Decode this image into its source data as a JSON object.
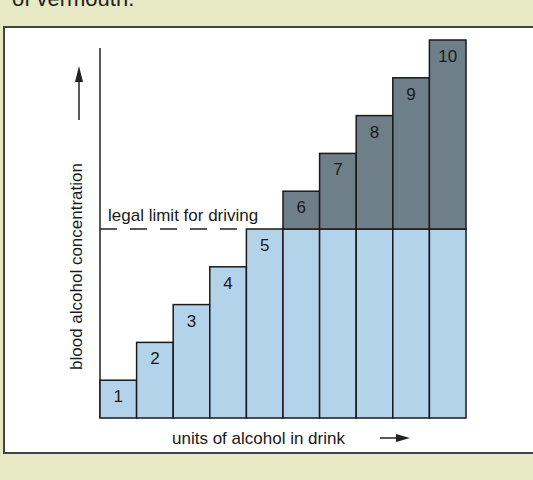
{
  "caption_top": "of vermouth.",
  "colors": {
    "background": "#e6e9c4",
    "panel": "#ffffff",
    "below_limit": "#b3d3ea",
    "above_limit": "#6f7f8a",
    "outline": "#1a1a1a"
  },
  "labels": {
    "y_axis": "blood alcohol concentration",
    "x_axis": "units of alcohol in drink",
    "limit_line": "legal limit for driving"
  },
  "chart_data": {
    "type": "bar",
    "title": "",
    "xlabel": "units of alcohol in drink",
    "ylabel": "blood alcohol concentration",
    "categories": [
      "1",
      "2",
      "3",
      "4",
      "5",
      "6",
      "7",
      "8",
      "9",
      "10"
    ],
    "values": [
      1,
      2,
      3,
      4,
      5,
      6,
      7,
      8,
      9,
      10
    ],
    "threshold": {
      "label": "legal limit for driving",
      "value": 5,
      "style": "dashed"
    },
    "ylim": [
      0,
      10
    ],
    "grid": false,
    "legend": null,
    "annotation": "portion of each bar above the legal limit is shaded dark grey"
  }
}
